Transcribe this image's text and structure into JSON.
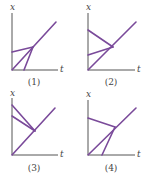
{
  "figure": {
    "line_color": "#7a4a9a",
    "axis_color": "#555555",
    "panels": [
      {
        "label": "(1)",
        "x_axis_label": "x",
        "t_axis_label": "t",
        "origin": [
          12,
          70
        ],
        "axis_top": 13,
        "axis_right": 58,
        "x_label_pos": [
          10,
          10
        ],
        "t_label_pos": [
          60,
          72
        ],
        "panel_label_pos": [
          34,
          85
        ],
        "lines": [
          {
            "from": [
              12,
              70
            ],
            "to": [
              56,
              22
            ]
          },
          {
            "from": [
              12,
              52
            ],
            "to": [
              33,
              47
            ]
          },
          {
            "from": [
              24,
              70
            ],
            "to": [
              33,
              47
            ]
          }
        ]
      },
      {
        "label": "(2)",
        "x_axis_label": "x",
        "t_axis_label": "t",
        "origin": [
          88,
          70
        ],
        "axis_top": 13,
        "axis_right": 135,
        "x_label_pos": [
          86,
          10
        ],
        "t_label_pos": [
          137,
          72
        ],
        "panel_label_pos": [
          111,
          85
        ],
        "lines": [
          {
            "from": [
              88,
              70
            ],
            "to": [
              136,
              22
            ]
          },
          {
            "from": [
              88,
              30
            ],
            "to": [
              113,
              47
            ]
          },
          {
            "from": [
              88,
              55
            ],
            "to": [
              113,
              47
            ]
          }
        ]
      },
      {
        "label": "(3)",
        "x_axis_label": "x",
        "t_axis_label": "t",
        "origin": [
          12,
          155
        ],
        "axis_top": 98,
        "axis_right": 58,
        "x_label_pos": [
          10,
          96
        ],
        "t_label_pos": [
          60,
          157
        ],
        "panel_label_pos": [
          34,
          171
        ],
        "lines": [
          {
            "from": [
              12,
              155
            ],
            "to": [
              55,
              108
            ]
          },
          {
            "from": [
              12,
              105
            ],
            "to": [
              35,
              131
            ]
          },
          {
            "from": [
              12,
              116
            ],
            "to": [
              35,
              131
            ]
          }
        ]
      },
      {
        "label": "(4)",
        "x_axis_label": "x",
        "t_axis_label": "t",
        "origin": [
          88,
          155
        ],
        "axis_top": 100,
        "axis_right": 135,
        "x_label_pos": [
          86,
          97
        ],
        "t_label_pos": [
          137,
          157
        ],
        "panel_label_pos": [
          111,
          171
        ],
        "lines": [
          {
            "from": [
              88,
              155
            ],
            "to": [
              136,
              108
            ]
          },
          {
            "from": [
              88,
              118
            ],
            "to": [
              115,
              127
            ]
          },
          {
            "from": [
              102,
              155
            ],
            "to": [
              115,
              127
            ]
          }
        ]
      }
    ]
  }
}
